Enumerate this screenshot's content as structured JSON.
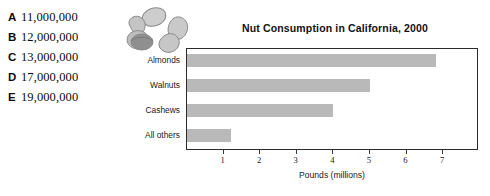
{
  "answers": {
    "options": [
      {
        "letter": "A",
        "value": "11,000,000"
      },
      {
        "letter": "B",
        "value": "12,000,000"
      },
      {
        "letter": "C",
        "value": "13,000,000"
      },
      {
        "letter": "D",
        "value": "17,000,000"
      },
      {
        "letter": "E",
        "value": "19,000,000"
      }
    ]
  },
  "illustration": {
    "name": "nut-cluster-illustration"
  },
  "chart_data": {
    "type": "bar",
    "orientation": "horizontal",
    "title": "Nut Consumption in California, 2000",
    "categories": [
      "Almonds",
      "Walnuts",
      "Cashews",
      "All others"
    ],
    "values": [
      6.8,
      5.0,
      4.0,
      1.2
    ],
    "xlabel": "Pounds (millions)",
    "ylabel": "",
    "xlim": [
      0,
      7.9
    ],
    "xticks": [
      1,
      2,
      3,
      4,
      5,
      6,
      7
    ],
    "xtick_labels": [
      "1",
      "2",
      "3",
      "4",
      "5",
      "6",
      "7"
    ],
    "grid": false,
    "legend": false,
    "bar_color": "#b9b9b9",
    "frame_color": "#2b2b2b"
  }
}
